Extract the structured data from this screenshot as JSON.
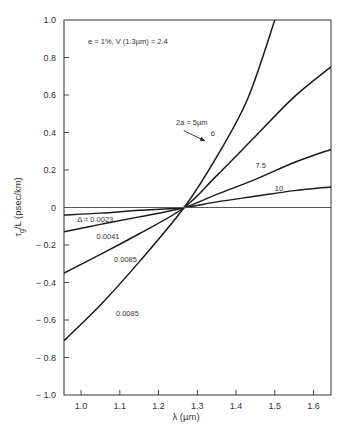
{
  "chart_data": {
    "type": "line",
    "title": "",
    "annotation": "e = 1%, V (1.3µm) = 2.4",
    "xlabel": "λ (µm)",
    "ylabel": "τg/L (psec/km)",
    "ylabel_main": "τ",
    "ylabel_sub": "g",
    "ylabel_rest": "/L (psec/km)",
    "xlim": [
      0.956,
      1.645
    ],
    "ylim": [
      -1.0,
      1.0
    ],
    "xticks": [
      1.0,
      1.1,
      1.2,
      1.3,
      1.4,
      1.5,
      1.6
    ],
    "xtick_labels": [
      "1.0",
      "1.1",
      "1.2",
      "1.3",
      "1.4",
      "1.5",
      "1.6"
    ],
    "yticks": [
      1.0,
      0.8,
      0.6,
      0.4,
      0.2,
      0,
      -0.2,
      -0.4,
      -0.6,
      -0.8,
      -1.0
    ],
    "ytick_labels": [
      "1.0",
      "0.8",
      "0.6",
      "0.4",
      "0.2",
      "0",
      "− 0.2",
      "− 0.4",
      "− 0.6",
      "− 0.8",
      "− 1.0"
    ],
    "grid": false,
    "legend": "none (inline labels)",
    "crossing_point": {
      "x": 1.266,
      "y": 0
    },
    "series": [
      {
        "name": "2a = 5µm",
        "label": "2a = 5µm",
        "x": [
          0.956,
          1.05,
          1.15,
          1.266,
          1.35,
          1.43,
          1.5
        ],
        "y": [
          -0.71,
          -0.52,
          -0.29,
          0.0,
          0.27,
          0.58,
          1.0
        ]
      },
      {
        "name": "6",
        "label": "6",
        "x": [
          0.956,
          1.05,
          1.15,
          1.266,
          1.35,
          1.45,
          1.55,
          1.645
        ],
        "y": [
          -0.35,
          -0.25,
          -0.14,
          0.0,
          0.17,
          0.38,
          0.59,
          0.75
        ]
      },
      {
        "name": "7.5",
        "label": "7.5",
        "x": [
          0.956,
          1.05,
          1.15,
          1.266,
          1.35,
          1.45,
          1.55,
          1.645
        ],
        "y": [
          -0.13,
          -0.09,
          -0.05,
          0.0,
          0.07,
          0.15,
          0.24,
          0.31
        ]
      },
      {
        "name": "10",
        "label": "10",
        "x": [
          0.956,
          1.05,
          1.15,
          1.266,
          1.35,
          1.45,
          1.55,
          1.645
        ],
        "y": [
          -0.04,
          -0.03,
          -0.015,
          0.0,
          0.03,
          0.06,
          0.09,
          0.11
        ]
      },
      {
        "name": "zero",
        "label": "",
        "x": [
          0.956,
          1.645
        ],
        "y": [
          0,
          0
        ]
      }
    ],
    "inline_labels": [
      {
        "text": "Δ = 0.0023",
        "x": 0.99,
        "y": -0.075
      },
      {
        "text": "0.0041",
        "x": 1.04,
        "y": -0.17
      },
      {
        "text": "0.0085",
        "x": 1.085,
        "y": -0.29
      },
      {
        "text": "0.0085",
        "x": 1.09,
        "y": -0.58
      },
      {
        "text": "2a = 5µm",
        "x": 1.245,
        "y": 0.44
      },
      {
        "text": "6",
        "x": 1.335,
        "y": 0.38
      },
      {
        "text": "7.5",
        "x": 1.45,
        "y": 0.21
      },
      {
        "text": "10",
        "x": 1.5,
        "y": 0.09
      }
    ]
  }
}
